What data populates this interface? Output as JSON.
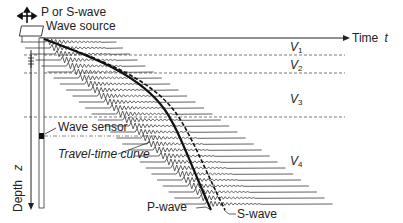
{
  "labels": {
    "p_or_s_wave": "P or S-wave",
    "wave_source": "Wave source",
    "time_axis": "Time",
    "time_symbol": "t",
    "depth_axis": "Depth",
    "depth_symbol": "z",
    "wave_sensor": "Wave sensor",
    "travel_time_curve": "Travel-time curve",
    "p_wave": "P-wave",
    "s_wave": "S-wave"
  },
  "layers": [
    {
      "symbol": "V",
      "index": "1"
    },
    {
      "symbol": "V",
      "index": "2"
    },
    {
      "symbol": "V",
      "index": "3"
    },
    {
      "symbol": "V",
      "index": "4"
    }
  ],
  "colors": {
    "line": "#1a1a1a",
    "trace": "#3a3a3a",
    "dashed": "#555555",
    "background": "#ffffff"
  }
}
